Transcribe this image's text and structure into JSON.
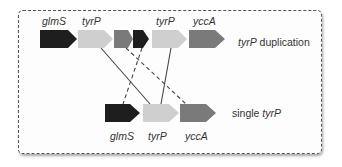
{
  "colors": {
    "glmS": "#1e1e1e",
    "tyrP": "#cfcfcf",
    "yccA": "#7a7a7a",
    "fragment_gray": "#7a7a7a",
    "line": "#444444",
    "border": "#555555"
  },
  "duplication_row": {
    "label_gene": "tyrP",
    "label_suffix": " duplication",
    "genes": [
      {
        "name": "glmS",
        "label": "glmS"
      },
      {
        "name": "tyrP",
        "label": "tyrP"
      },
      {
        "name": "yccA-fragment",
        "label": ""
      },
      {
        "name": "glmS-fragment",
        "label": ""
      },
      {
        "name": "tyrP",
        "label": "tyrP"
      },
      {
        "name": "yccA",
        "label": "yccA"
      }
    ]
  },
  "single_row": {
    "label_prefix": "single ",
    "label_gene": "tyrP",
    "genes": [
      {
        "name": "glmS",
        "label": "glmS"
      },
      {
        "name": "tyrP",
        "label": "tyrP"
      },
      {
        "name": "yccA",
        "label": "yccA"
      }
    ]
  },
  "connections": [
    {
      "from": "tyrP (copy 1)",
      "to": "tyrP",
      "style": "solid"
    },
    {
      "from": "tyrP (copy 2)",
      "to": "tyrP",
      "style": "solid"
    },
    {
      "from": "glmS-fragment",
      "to": "glmS",
      "style": "dashed"
    },
    {
      "from": "yccA-fragment",
      "to": "yccA",
      "style": "dashed"
    }
  ]
}
